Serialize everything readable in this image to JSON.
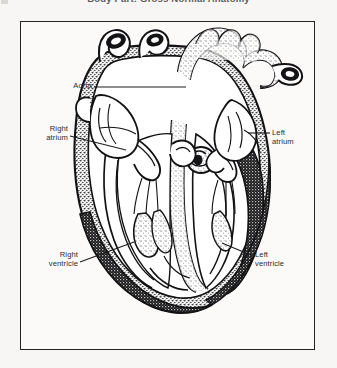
{
  "page": {
    "background_color": "#f7f6f4",
    "width": 337,
    "height": 368
  },
  "title": {
    "text": "Body Part: Gross Normal Anatomy",
    "clipped": true
  },
  "figure": {
    "frame": {
      "border_color": "#232326",
      "fill_color": "#fbfaf9"
    },
    "illustration": {
      "subject": "human heart",
      "view": "anterior coronal cross-section",
      "style": "black-and-white stippled line engraving"
    },
    "labels": [
      {
        "id": "aorta",
        "text": "Aorta",
        "align": "right"
      },
      {
        "id": "right-atrium",
        "text": "Right\natrium",
        "align": "right"
      },
      {
        "id": "left-atrium",
        "text": "Left\natrium",
        "align": "left"
      },
      {
        "id": "right-ventricle",
        "text": "Right\nventricle",
        "align": "right"
      },
      {
        "id": "left-ventricle",
        "text": "Left\nventricle",
        "align": "left"
      }
    ]
  }
}
